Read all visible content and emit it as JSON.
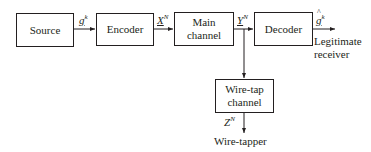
{
  "blocks": {
    "source": "Source",
    "encoder": "Encoder",
    "main_channel_line1": "Main",
    "main_channel_line2": "channel",
    "decoder": "Decoder",
    "wiretap_line1": "Wire-tap",
    "wiretap_line2": "channel"
  },
  "signals": {
    "source_out": {
      "base": "g",
      "sup": "k"
    },
    "encoder_out": {
      "base": "X",
      "sup": "N"
    },
    "channel_out": {
      "base": "Y",
      "sup": "N"
    },
    "decoder_out": {
      "base": "g",
      "sup": "k"
    },
    "wiretap_out": {
      "base": "Z",
      "sup": "N"
    }
  },
  "endpoints": {
    "receiver_line1": "Legitimate",
    "receiver_line2": "receiver",
    "wiretapper": "Wire-tapper"
  },
  "colors": {
    "stroke": "#231f20",
    "background": "#ffffff"
  }
}
